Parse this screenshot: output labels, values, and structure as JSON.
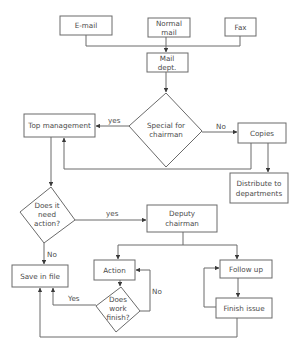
{
  "diagram": {
    "type": "flowchart",
    "nodes": {
      "email": {
        "label": "E-mail",
        "shape": "rect"
      },
      "normal_mail": {
        "label_line1": "Normal",
        "label_line2": "mail",
        "shape": "rect"
      },
      "fax": {
        "label": "Fax",
        "shape": "rect"
      },
      "mail_dept": {
        "label_line1": "Mail",
        "label_line2": "dept.",
        "shape": "rect"
      },
      "special_for_chairman": {
        "label_line1": "Special for",
        "label_line2": "chairman",
        "shape": "diamond"
      },
      "top_management": {
        "label": "Top management",
        "shape": "rect"
      },
      "copies": {
        "label": "Copies",
        "shape": "rect"
      },
      "distribute": {
        "label_line1": "Distribute to",
        "label_line2": "departments",
        "shape": "rect"
      },
      "need_action": {
        "label_line1": "Does it",
        "label_line2": "need",
        "label_line3": "action?",
        "shape": "diamond"
      },
      "deputy_chairman": {
        "label_line1": "Deputy",
        "label_line2": "chairman",
        "shape": "rect"
      },
      "save_in_file": {
        "label": "Save in file",
        "shape": "rect"
      },
      "action": {
        "label": "Action",
        "shape": "rect"
      },
      "work_finish": {
        "label_line1": "Does",
        "label_line2": "work",
        "label_line3": "finish?",
        "shape": "diamond"
      },
      "follow_up": {
        "label": "Follow up",
        "shape": "rect"
      },
      "finish_issue": {
        "label": "Finish issue",
        "shape": "rect"
      }
    },
    "edge_labels": {
      "special_yes": "yes",
      "special_no": "No",
      "need_action_yes": "yes",
      "need_action_no": "No",
      "work_finish_yes": "Yes",
      "work_finish_no": "No"
    },
    "edges": [
      {
        "from": "email",
        "to": "mail_dept"
      },
      {
        "from": "normal_mail",
        "to": "mail_dept"
      },
      {
        "from": "fax",
        "to": "mail_dept"
      },
      {
        "from": "mail_dept",
        "to": "special_for_chairman"
      },
      {
        "from": "special_for_chairman",
        "to": "top_management",
        "label": "yes"
      },
      {
        "from": "special_for_chairman",
        "to": "copies",
        "label": "No"
      },
      {
        "from": "copies",
        "to": "top_management"
      },
      {
        "from": "copies",
        "to": "distribute"
      },
      {
        "from": "top_management",
        "to": "need_action"
      },
      {
        "from": "need_action",
        "to": "deputy_chairman",
        "label": "yes"
      },
      {
        "from": "need_action",
        "to": "save_in_file",
        "label": "No"
      },
      {
        "from": "deputy_chairman",
        "to": "action"
      },
      {
        "from": "deputy_chairman",
        "to": "follow_up"
      },
      {
        "from": "action",
        "to": "work_finish"
      },
      {
        "from": "work_finish",
        "to": "action",
        "label": "No"
      },
      {
        "from": "work_finish",
        "to": "save_in_file",
        "label": "Yes"
      },
      {
        "from": "follow_up",
        "to": "finish_issue"
      },
      {
        "from": "finish_issue",
        "to": "follow_up"
      },
      {
        "from": "finish_issue",
        "to": "save_in_file"
      }
    ]
  }
}
